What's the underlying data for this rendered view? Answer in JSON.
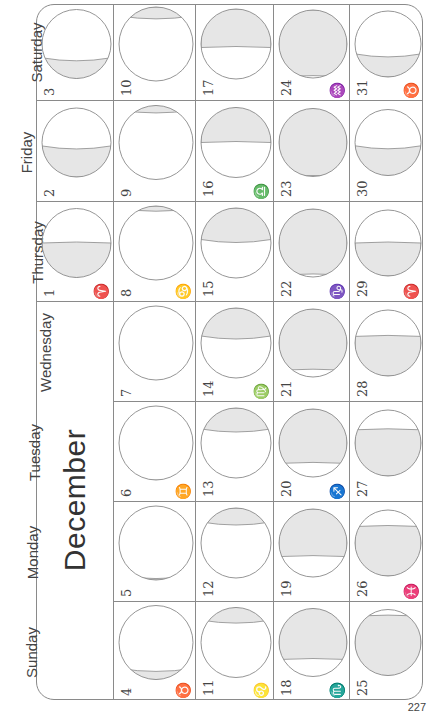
{
  "month_title": "December",
  "page_number": "227",
  "weekday_headers": [
    "Saturday",
    "Friday",
    "Thursday",
    "Wednesday",
    "Tuesday",
    "Monday",
    "Sunday"
  ],
  "moon_shade_color": "#e6e6e6",
  "line_color": "#8a8a8a",
  "days": [
    {
      "day": "1",
      "weekday": "Thursday",
      "sign": "♈"
    },
    {
      "day": "2",
      "weekday": "Friday",
      "sign": ""
    },
    {
      "day": "3",
      "weekday": "Saturday",
      "sign": ""
    },
    {
      "day": "4",
      "weekday": "Sunday",
      "sign": "♉"
    },
    {
      "day": "5",
      "weekday": "Monday",
      "sign": ""
    },
    {
      "day": "6",
      "weekday": "Tuesday",
      "sign": "♊"
    },
    {
      "day": "7",
      "weekday": "Wednesday",
      "sign": ""
    },
    {
      "day": "8",
      "weekday": "Thursday",
      "sign": "♋"
    },
    {
      "day": "9",
      "weekday": "Friday",
      "sign": ""
    },
    {
      "day": "10",
      "weekday": "Saturday",
      "sign": ""
    },
    {
      "day": "11",
      "weekday": "Sunday",
      "sign": "♌"
    },
    {
      "day": "12",
      "weekday": "Monday",
      "sign": ""
    },
    {
      "day": "13",
      "weekday": "Tuesday",
      "sign": ""
    },
    {
      "day": "14",
      "weekday": "Wednesday",
      "sign": "♍"
    },
    {
      "day": "15",
      "weekday": "Thursday",
      "sign": ""
    },
    {
      "day": "16",
      "weekday": "Friday",
      "sign": "♎"
    },
    {
      "day": "17",
      "weekday": "Saturday",
      "sign": ""
    },
    {
      "day": "18",
      "weekday": "Sunday",
      "sign": "♏"
    },
    {
      "day": "19",
      "weekday": "Monday",
      "sign": ""
    },
    {
      "day": "20",
      "weekday": "Tuesday",
      "sign": "♐"
    },
    {
      "day": "21",
      "weekday": "Wednesday",
      "sign": ""
    },
    {
      "day": "22",
      "weekday": "Thursday",
      "sign": "♑"
    },
    {
      "day": "23",
      "weekday": "Friday",
      "sign": ""
    },
    {
      "day": "24",
      "weekday": "Saturday",
      "sign": "♒"
    },
    {
      "day": "25",
      "weekday": "Sunday",
      "sign": ""
    },
    {
      "day": "26",
      "weekday": "Monday",
      "sign": "♓"
    },
    {
      "day": "27",
      "weekday": "Tuesday",
      "sign": ""
    },
    {
      "day": "28",
      "weekday": "Wednesday",
      "sign": ""
    },
    {
      "day": "29",
      "weekday": "Thursday",
      "sign": "♈"
    },
    {
      "day": "30",
      "weekday": "Friday",
      "sign": ""
    },
    {
      "day": "31",
      "weekday": "Saturday",
      "sign": "♉"
    }
  ]
}
